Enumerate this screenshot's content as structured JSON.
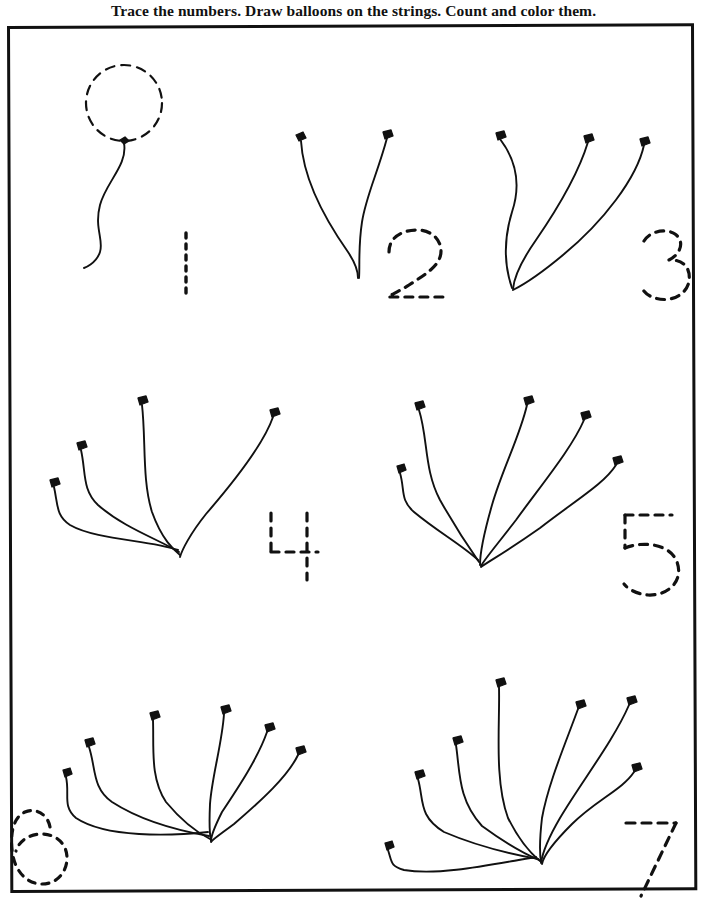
{
  "page": {
    "title": "Trace the numbers. Draw balloons on the strings. Count and color them.",
    "width": 707,
    "height": 915,
    "background_color": "#ffffff",
    "ink_color": "#111111",
    "frame": {
      "name": "worksheet-border",
      "border_color": "#111111",
      "border_width_px": 3
    }
  },
  "exercises": [
    {
      "number": "1",
      "count": 1,
      "numeral_style": "dashed-trace",
      "balloon_drawn": true,
      "strings": 1,
      "row": 1,
      "column": 1,
      "note": "One dashed balloon already drawn on a wavy string"
    },
    {
      "number": "2",
      "count": 2,
      "numeral_style": "dashed-trace",
      "balloon_drawn": false,
      "strings": 2,
      "row": 1,
      "column": 2,
      "note": "Two empty strings"
    },
    {
      "number": "3",
      "count": 3,
      "numeral_style": "dashed-trace",
      "balloon_drawn": false,
      "strings": 3,
      "row": 1,
      "column": 3,
      "note": "Three empty strings"
    },
    {
      "number": "4",
      "count": 4,
      "numeral_style": "dashed-trace",
      "balloon_drawn": false,
      "strings": 4,
      "row": 2,
      "column": 1,
      "note": "Four empty strings"
    },
    {
      "number": "5",
      "count": 5,
      "numeral_style": "dashed-trace",
      "balloon_drawn": false,
      "strings": 5,
      "row": 2,
      "column": 2,
      "note": "Five empty strings"
    },
    {
      "number": "6",
      "count": 6,
      "numeral_style": "dashed-trace",
      "balloon_drawn": false,
      "strings": 6,
      "row": 3,
      "column": 1,
      "note": "Six empty strings"
    },
    {
      "number": "7",
      "count": 7,
      "numeral_style": "dashed-trace",
      "balloon_drawn": false,
      "strings": 7,
      "row": 3,
      "column": 2,
      "note": "Seven empty strings"
    }
  ]
}
